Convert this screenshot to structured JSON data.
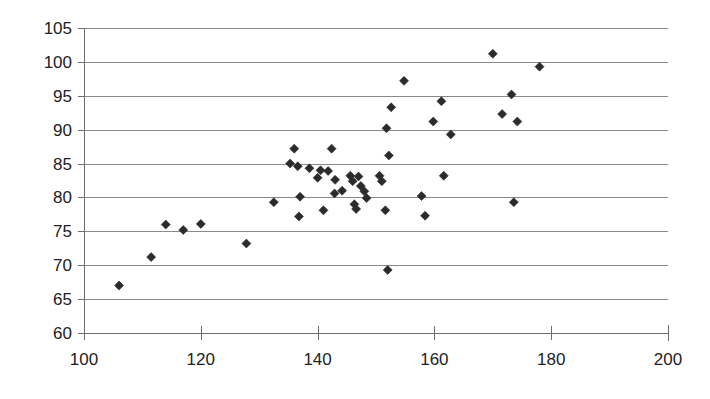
{
  "chart": {
    "type": "scatter",
    "marker_color": "#2b2b2b",
    "gridline_color": "#8a8a8a",
    "axis_color": "#6d6d6d",
    "background_color": "#ffffff"
  },
  "chart_data": {
    "type": "scatter",
    "title": "",
    "subtitle": "",
    "xlabel": "",
    "ylabel": "",
    "xlim": [
      100,
      200
    ],
    "ylim": [
      60,
      105
    ],
    "xticks": [
      100,
      120,
      140,
      160,
      180,
      200
    ],
    "yticks": [
      60,
      65,
      70,
      75,
      80,
      85,
      90,
      95,
      100,
      105
    ],
    "xtick_labels": [
      "100",
      "120",
      "140",
      "160",
      "180",
      "200"
    ],
    "ytick_labels": [
      "60",
      "65",
      "70",
      "75",
      "80",
      "85",
      "90",
      "95",
      "100",
      "105"
    ],
    "grid": "horizontal",
    "legend": "none",
    "annotations": [],
    "series": [
      {
        "name": "series1",
        "marker": "diamond",
        "color": "#2b2b2b",
        "points": [
          [
            106.0,
            67.0
          ],
          [
            111.5,
            71.2
          ],
          [
            114.0,
            76.0
          ],
          [
            117.0,
            75.2
          ],
          [
            120.0,
            76.1
          ],
          [
            127.8,
            73.2
          ],
          [
            132.5,
            79.3
          ],
          [
            135.3,
            85.0
          ],
          [
            136.0,
            87.2
          ],
          [
            136.6,
            84.6
          ],
          [
            137.0,
            80.1
          ],
          [
            136.8,
            77.2
          ],
          [
            138.6,
            84.3
          ],
          [
            140.0,
            82.9
          ],
          [
            140.5,
            84.0
          ],
          [
            141.0,
            78.1
          ],
          [
            141.8,
            83.9
          ],
          [
            142.4,
            87.2
          ],
          [
            142.9,
            80.6
          ],
          [
            143.0,
            82.6
          ],
          [
            144.2,
            81.0
          ],
          [
            145.6,
            83.2
          ],
          [
            146.0,
            82.4
          ],
          [
            146.3,
            79.0
          ],
          [
            146.6,
            78.3
          ],
          [
            147.0,
            83.1
          ],
          [
            147.4,
            81.7
          ],
          [
            148.0,
            80.9
          ],
          [
            148.4,
            79.9
          ],
          [
            150.6,
            83.2
          ],
          [
            151.0,
            82.4
          ],
          [
            151.6,
            78.1
          ],
          [
            151.8,
            90.2
          ],
          [
            152.0,
            69.3
          ],
          [
            152.2,
            86.2
          ],
          [
            152.6,
            93.3
          ],
          [
            154.8,
            97.2
          ],
          [
            157.8,
            80.2
          ],
          [
            158.4,
            77.3
          ],
          [
            159.8,
            91.2
          ],
          [
            161.2,
            94.2
          ],
          [
            161.6,
            83.2
          ],
          [
            162.8,
            89.3
          ],
          [
            170.0,
            101.2
          ],
          [
            171.6,
            92.3
          ],
          [
            173.2,
            95.2
          ],
          [
            173.6,
            79.3
          ],
          [
            174.2,
            91.2
          ],
          [
            178.0,
            99.3
          ]
        ]
      }
    ]
  },
  "layout": {
    "plot_left": 84,
    "plot_right": 668,
    "plot_top": 28,
    "plot_bottom": 333,
    "marker_size": 9
  }
}
